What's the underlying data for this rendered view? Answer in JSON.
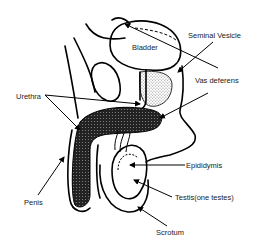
{
  "diagram": {
    "labels": {
      "bladder": "Bladder",
      "seminal_vesicle": "Seminal Vesicle",
      "vas_deferens": "Vas deferens",
      "urethra": "Urethra",
      "epididymis": "Epididymis",
      "penis": "Penis",
      "testis": "Testis(one testes)",
      "scrotum": "Scrotum"
    },
    "colors": {
      "line": "#000000",
      "background": "#ffffff",
      "stipple": "#9a9a9a",
      "label_text": "#222222"
    }
  }
}
